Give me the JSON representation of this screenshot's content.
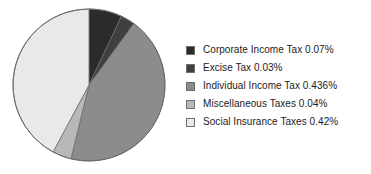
{
  "chart_data": {
    "type": "pie",
    "title": "",
    "subtitle": "",
    "xlabel": "",
    "ylabel": "",
    "grid": false,
    "legend_position": "right",
    "start_angle_deg": 0,
    "direction": "clockwise",
    "categories": [
      "Corporate Income Tax",
      "Excise Tax",
      "Individual Income Tax",
      "Miscellaneous Taxes",
      "Social Insurance Taxes"
    ],
    "values": [
      0.07,
      0.03,
      0.436,
      0.04,
      0.42
    ],
    "value_unit": "%",
    "colors": [
      "#2b2b2b",
      "#3f3f3f",
      "#8c8c8c",
      "#b8b8b8",
      "#e9e9e9"
    ],
    "slices": [
      {
        "name": "Corporate Income Tax",
        "value": 0.07,
        "value_text": "0.07%",
        "legend_text": "Corporate Income Tax 0.07%",
        "color": "#2b2b2b",
        "angle_deg": 25.3
      },
      {
        "name": "Excise Tax",
        "value": 0.03,
        "value_text": "0.03%",
        "legend_text": "Excise Tax 0.03%",
        "color": "#3f3f3f",
        "angle_deg": 10.8
      },
      {
        "name": "Individual Income Tax",
        "value": 0.436,
        "value_text": "0.436%",
        "legend_text": "Individual Income Tax 0.436%",
        "color": "#8c8c8c",
        "angle_deg": 157.6
      },
      {
        "name": "Miscellaneous Taxes",
        "value": 0.04,
        "value_text": "0.04%",
        "legend_text": "Miscellaneous Taxes 0.04%",
        "color": "#b8b8b8",
        "angle_deg": 14.5
      },
      {
        "name": "Social Insurance Taxes",
        "value": 0.42,
        "value_text": "0.42%",
        "legend_text": "Social Insurance Taxes 0.42%",
        "color": "#e9e9e9",
        "angle_deg": 151.8
      }
    ]
  },
  "pie": {
    "center_x": 89,
    "center_y": 85,
    "radius": 76,
    "outline_color": "#6b6b6b"
  },
  "legend": {
    "rows": [
      {
        "label": "Corporate Income Tax 0.07%",
        "color": "#2b2b2b"
      },
      {
        "label": "Excise Tax 0.03%",
        "color": "#3f3f3f"
      },
      {
        "label": "Individual Income Tax 0.436%",
        "color": "#8c8c8c"
      },
      {
        "label": "Miscellaneous Taxes 0.04%",
        "color": "#b8b8b8"
      },
      {
        "label": "Social Insurance Taxes 0.42%",
        "color": "#e9e9e9"
      }
    ]
  }
}
